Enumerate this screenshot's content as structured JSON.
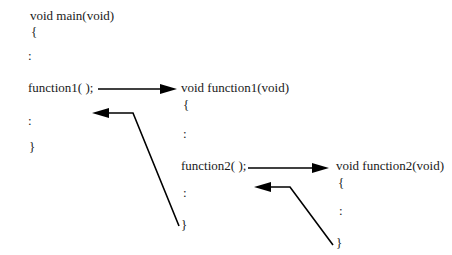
{
  "page": {
    "background_color": "#ffffff",
    "text_color": "#1a1a1a",
    "arrow_color": "#000000"
  },
  "blocks": {
    "main": {
      "header": "void main(void)",
      "open_brace": "{",
      "colon1": ":",
      "call": "function1( );",
      "colon2": ":",
      "close_brace": "}"
    },
    "function1": {
      "header": "void function1(void)",
      "open_brace": "{",
      "colon1": ":",
      "call": "function2( );",
      "colon2": ":",
      "close_brace": "}"
    },
    "function2": {
      "header": "void function2(void)",
      "open_brace": "{",
      "colon1": ":",
      "close_brace": "}"
    }
  },
  "arrows": {
    "call_function1": "call-arrow-main-to-function1",
    "return_function1": "return-arrow-function1-to-main",
    "call_function2": "call-arrow-function1-to-function2",
    "return_function2": "return-arrow-function2-to-function1"
  }
}
